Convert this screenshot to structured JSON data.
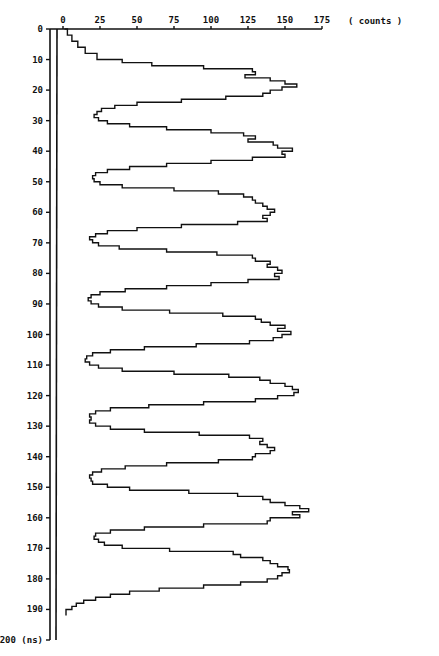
{
  "chart_data": {
    "type": "line",
    "orientation": "vertical (time on y-axis, counts on x-axis)",
    "title": "",
    "xlabel": "( counts )",
    "ylabel": "(ns)",
    "x_axis": {
      "position": "top",
      "range": [
        0,
        175
      ],
      "ticks": [
        0,
        25,
        50,
        75,
        100,
        125,
        150,
        175
      ],
      "tick_labels": [
        "0",
        "25",
        "50",
        "75",
        "100",
        "125",
        "150",
        "175"
      ],
      "unit_label": "( counts )"
    },
    "y_axis": {
      "position": "left",
      "range": [
        0,
        200
      ],
      "inverted": true,
      "ticks": [
        0,
        10,
        20,
        30,
        40,
        50,
        60,
        70,
        80,
        90,
        100,
        110,
        120,
        130,
        140,
        150,
        160,
        170,
        180,
        190,
        200
      ],
      "tick_labels": [
        "0",
        "10",
        "20",
        "30",
        "40",
        "50",
        "60",
        "70",
        "80",
        "90",
        "100",
        "110",
        "120",
        "130",
        "140",
        "150",
        "160",
        "170",
        "180",
        "190",
        "200 (ns)"
      ],
      "double_axis_line": true
    },
    "grid": false,
    "legend": null,
    "peaks": [
      {
        "ns": 19,
        "counts": 158
      },
      {
        "ns": 40,
        "counts": 155
      },
      {
        "ns": 60,
        "counts": 143
      },
      {
        "ns": 80,
        "counts": 148
      },
      {
        "ns": 100,
        "counts": 154
      },
      {
        "ns": 121,
        "counts": 159
      },
      {
        "ns": 141,
        "counts": 143
      },
      {
        "ns": 162,
        "counts": 166
      },
      {
        "ns": 181,
        "counts": 153
      }
    ],
    "troughs": [
      {
        "ns": 29,
        "counts": 21
      },
      {
        "ns": 49,
        "counts": 20
      },
      {
        "ns": 69,
        "counts": 18
      },
      {
        "ns": 89,
        "counts": 17
      },
      {
        "ns": 110,
        "counts": 15
      },
      {
        "ns": 130,
        "counts": 18
      },
      {
        "ns": 150,
        "counts": 18
      },
      {
        "ns": 170,
        "counts": 21
      }
    ],
    "series": [
      {
        "name": "counts",
        "x_ns": [
          0,
          2,
          4,
          6,
          8,
          10,
          11,
          12,
          13,
          14,
          15,
          16,
          17,
          18,
          19,
          20,
          21,
          22,
          23,
          24,
          25,
          26,
          27,
          28,
          29,
          30,
          31,
          32,
          33,
          34,
          35,
          36,
          37,
          38,
          39,
          40,
          41,
          42,
          43,
          44,
          45,
          46,
          47,
          48,
          49,
          50,
          51,
          52,
          53,
          54,
          55,
          56,
          57,
          58,
          59,
          60,
          61,
          62,
          63,
          64,
          65,
          66,
          67,
          68,
          69,
          70,
          71,
          72,
          73,
          74,
          75,
          76,
          77,
          78,
          79,
          80,
          81,
          82,
          83,
          84,
          85,
          86,
          87,
          88,
          89,
          90,
          91,
          92,
          93,
          94,
          95,
          96,
          97,
          98,
          99,
          100,
          101,
          102,
          103,
          104,
          105,
          106,
          107,
          108,
          109,
          110,
          111,
          112,
          113,
          114,
          115,
          116,
          117,
          118,
          119,
          120,
          121,
          122,
          123,
          124,
          125,
          126,
          127,
          128,
          129,
          130,
          131,
          132,
          133,
          134,
          135,
          136,
          137,
          138,
          139,
          140,
          141,
          142,
          143,
          144,
          145,
          146,
          147,
          148,
          149,
          150,
          151,
          152,
          153,
          154,
          155,
          156,
          157,
          158,
          159,
          160,
          161,
          162,
          163,
          164,
          165,
          166,
          167,
          168,
          169,
          170,
          171,
          172,
          173,
          174,
          175,
          176,
          177,
          178,
          179,
          180,
          181,
          182,
          183,
          184,
          185,
          186,
          187,
          188,
          189,
          190,
          192,
          194,
          196,
          198,
          199
        ],
        "values": [
          1,
          3,
          6,
          10,
          15,
          23,
          40,
          60,
          95,
          128,
          130,
          123,
          140,
          150,
          158,
          148,
          140,
          135,
          110,
          80,
          50,
          35,
          26,
          23,
          21,
          24,
          30,
          45,
          70,
          100,
          122,
          130,
          125,
          142,
          145,
          155,
          148,
          150,
          128,
          100,
          70,
          45,
          30,
          22,
          20,
          21,
          25,
          40,
          75,
          105,
          122,
          128,
          130,
          135,
          138,
          143,
          140,
          135,
          138,
          118,
          80,
          50,
          30,
          22,
          18,
          20,
          24,
          38,
          70,
          104,
          128,
          130,
          140,
          138,
          145,
          148,
          143,
          146,
          125,
          100,
          70,
          42,
          25,
          19,
          17,
          19,
          24,
          40,
          72,
          108,
          130,
          134,
          140,
          150,
          145,
          154,
          148,
          142,
          126,
          90,
          55,
          32,
          20,
          16,
          15,
          18,
          24,
          40,
          75,
          112,
          133,
          140,
          150,
          155,
          159,
          156,
          145,
          130,
          95,
          58,
          32,
          22,
          18,
          19,
          18,
          22,
          32,
          55,
          92,
          126,
          135,
          133,
          138,
          143,
          140,
          130,
          128,
          105,
          70,
          42,
          26,
          20,
          18,
          19,
          20,
          30,
          45,
          85,
          118,
          135,
          140,
          150,
          160,
          166,
          155,
          160,
          140,
          138,
          95,
          55,
          32,
          22,
          21,
          24,
          28,
          40,
          72,
          115,
          120,
          135,
          140,
          145,
          152,
          153,
          148,
          145,
          138,
          120,
          95,
          65,
          45,
          32,
          22,
          14,
          9,
          6,
          2
        ]
      }
    ]
  },
  "labels": {
    "x_unit": "( counts )",
    "y_unit": "(ns)"
  },
  "colors": {
    "line": "#111111",
    "background": "#ffffff"
  }
}
